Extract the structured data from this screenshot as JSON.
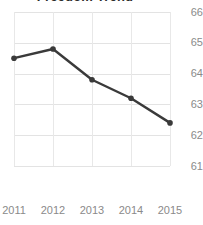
{
  "chart_data": {
    "type": "line",
    "title": "Freedom Trend",
    "xlabel": "",
    "ylabel": "",
    "categories": [
      "2011",
      "2012",
      "2013",
      "2014",
      "2015"
    ],
    "x": [
      2011,
      2012,
      2013,
      2014,
      2015
    ],
    "values": [
      64.5,
      64.8,
      63.8,
      63.2,
      62.4
    ],
    "series": [
      {
        "name": "Freedom Trend",
        "values": [
          64.5,
          64.8,
          63.8,
          63.2,
          62.4
        ]
      }
    ],
    "ylim": [
      61,
      66
    ],
    "yticks": [
      61,
      62,
      63,
      64,
      65,
      66
    ],
    "ytick_labels": [
      "61",
      "62",
      "63",
      "64",
      "65",
      "66"
    ],
    "xtick_labels": [
      "2011",
      "2012",
      "2013",
      "2014",
      "2015"
    ],
    "grid": true,
    "legend": false,
    "legend_position": "none",
    "y_axis_side": "right",
    "line_color": "#3a3a3a",
    "marker_color": "#3a3a3a",
    "grid_color": "#e3e3e3",
    "tick_label_color": "#8a8a8a",
    "title_color": "#2b2b2b",
    "background_color": "#ffffff",
    "marker": "circle",
    "line_width": 2.4
  }
}
